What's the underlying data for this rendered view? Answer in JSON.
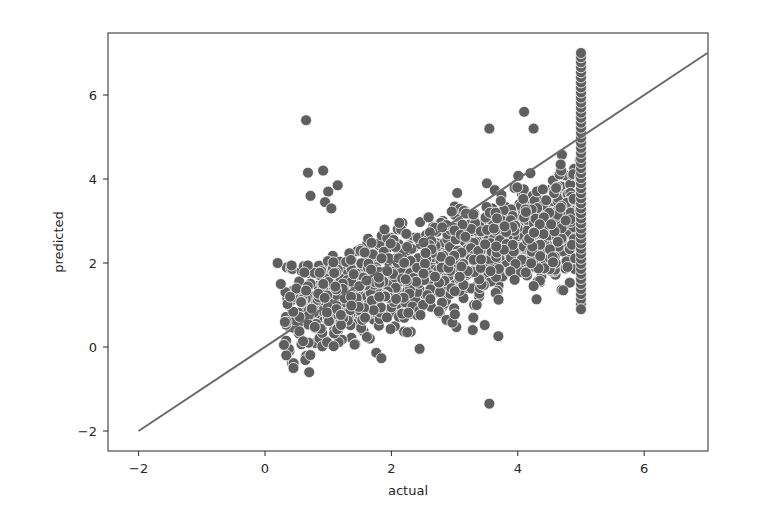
{
  "chart_data": {
    "type": "scatter",
    "title": "",
    "xlabel": "actual",
    "ylabel": "predicted",
    "xlim": [
      -2.4,
      7.3
    ],
    "ylim": [
      -2.4,
      7.5
    ],
    "x_ticks": [
      -2,
      0,
      2,
      4,
      6
    ],
    "y_ticks": [
      -2,
      0,
      2,
      4,
      6
    ],
    "x_tick_labels": [
      "−2",
      "0",
      "2",
      "4",
      "6"
    ],
    "y_tick_labels": [
      "−2",
      "0",
      "2",
      "4",
      "6"
    ],
    "grid": false,
    "legend": null,
    "point_color": "#5f5f5f",
    "point_edge_color": "#ffffff",
    "line_color": "#6b6b6b",
    "reference_line": {
      "x": [
        -2,
        7
      ],
      "y": [
        -2,
        7
      ],
      "label": "y = x"
    },
    "cluster_description": "Dense cloud from actual ~0.2 to 5.0, predicted roughly 0 to 4; vertical column of points at actual = 5.0 spanning predicted ~0.9 to 7.0",
    "notable_points": [
      {
        "x": 0.65,
        "y": 5.4
      },
      {
        "x": 0.68,
        "y": 4.15
      },
      {
        "x": 0.92,
        "y": 4.2
      },
      {
        "x": 0.72,
        "y": 3.6
      },
      {
        "x": 1.15,
        "y": 3.85
      },
      {
        "x": 1.0,
        "y": 3.7
      },
      {
        "x": 0.95,
        "y": 3.45
      },
      {
        "x": 1.05,
        "y": 3.3
      },
      {
        "x": 3.55,
        "y": -1.35
      },
      {
        "x": 4.1,
        "y": 5.6
      },
      {
        "x": 3.55,
        "y": 5.2
      },
      {
        "x": 4.25,
        "y": 5.2
      },
      {
        "x": 0.25,
        "y": 1.5
      },
      {
        "x": 0.2,
        "y": 2.0
      },
      {
        "x": 0.3,
        "y": 0.05
      },
      {
        "x": 0.7,
        "y": -0.6
      },
      {
        "x": 0.45,
        "y": -0.5
      },
      {
        "x": 2.25,
        "y": 0.35
      },
      {
        "x": 2.75,
        "y": 0.85
      },
      {
        "x": 3.35,
        "y": 1.0
      },
      {
        "x": 3.95,
        "y": 1.6
      },
      {
        "x": 4.25,
        "y": 1.45
      },
      {
        "x": 4.72,
        "y": 1.35
      },
      {
        "x": 5.0,
        "y": 0.9
      },
      {
        "x": 5.0,
        "y": 7.0
      }
    ]
  }
}
